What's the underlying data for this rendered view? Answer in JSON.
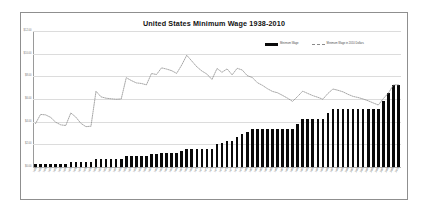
{
  "chart_data": {
    "type": "bar",
    "title": "United States Minimum Wage 1938-2010",
    "xlabel": "",
    "ylabel": "",
    "ylim": [
      0,
      12
    ],
    "yticks": [
      "$12.00",
      "$10.00",
      "$8.00",
      "$6.00",
      "$4.00",
      "$2.00",
      "$0.00"
    ],
    "grid": true,
    "legend_position": "top-right",
    "categories": [
      "1938",
      "1939",
      "1940",
      "1941",
      "1942",
      "1943",
      "1944",
      "1945",
      "1946",
      "1947",
      "1948",
      "1949",
      "1950",
      "1951",
      "1952",
      "1953",
      "1954",
      "1955",
      "1956",
      "1957",
      "1958",
      "1959",
      "1960",
      "1961",
      "1962",
      "1963",
      "1964",
      "1965",
      "1966",
      "1967",
      "1968",
      "1969",
      "1970",
      "1971",
      "1972",
      "1973",
      "1974",
      "1975",
      "1976",
      "1977",
      "1978",
      "1979",
      "1980",
      "1981",
      "1982",
      "1983",
      "1984",
      "1985",
      "1986",
      "1987",
      "1988",
      "1989",
      "1990",
      "1991",
      "1992",
      "1993",
      "1994",
      "1995",
      "1996",
      "1997",
      "1998",
      "1999",
      "2000",
      "2001",
      "2002",
      "2003",
      "2004",
      "2005",
      "2006",
      "2007",
      "2008",
      "2009",
      "2010"
    ],
    "series": [
      {
        "name": "Minimum Wage",
        "type": "bar",
        "color": "#0a0a0a",
        "values": [
          0.25,
          0.3,
          0.3,
          0.3,
          0.3,
          0.3,
          0.3,
          0.4,
          0.4,
          0.4,
          0.4,
          0.4,
          0.75,
          0.75,
          0.75,
          0.75,
          0.75,
          0.75,
          1.0,
          1.0,
          1.0,
          1.0,
          1.0,
          1.15,
          1.15,
          1.25,
          1.25,
          1.25,
          1.25,
          1.4,
          1.6,
          1.6,
          1.6,
          1.6,
          1.6,
          1.6,
          2.0,
          2.1,
          2.3,
          2.3,
          2.65,
          2.9,
          3.1,
          3.35,
          3.35,
          3.35,
          3.35,
          3.35,
          3.35,
          3.35,
          3.35,
          3.35,
          3.8,
          4.25,
          4.25,
          4.25,
          4.25,
          4.25,
          4.75,
          5.15,
          5.15,
          5.15,
          5.15,
          5.15,
          5.15,
          5.15,
          5.15,
          5.15,
          5.15,
          5.85,
          6.55,
          7.25,
          7.25
        ]
      },
      {
        "name": "Minimum Wage in 2010 Dollars",
        "type": "line",
        "style": "dotted",
        "color": "#8a8a8a",
        "values": [
          3.83,
          4.64,
          4.6,
          4.38,
          3.95,
          3.72,
          3.66,
          4.77,
          4.4,
          3.85,
          3.56,
          3.6,
          6.68,
          6.19,
          6.07,
          6.02,
          5.98,
          6.0,
          7.88,
          7.63,
          7.42,
          7.37,
          7.25,
          8.25,
          8.16,
          8.75,
          8.64,
          8.5,
          8.26,
          9.0,
          9.86,
          9.35,
          8.84,
          8.47,
          8.2,
          7.72,
          8.69,
          8.36,
          8.66,
          8.13,
          8.71,
          8.56,
          8.06,
          7.9,
          7.44,
          7.21,
          6.91,
          6.67,
          6.55,
          6.32,
          6.07,
          5.79,
          6.23,
          6.69,
          6.49,
          6.3,
          6.15,
          5.98,
          6.49,
          6.88,
          6.77,
          6.63,
          6.41,
          6.23,
          6.13,
          6.0,
          5.84,
          5.65,
          5.47,
          6.04,
          6.52,
          7.24,
          7.25
        ]
      }
    ]
  },
  "legend": {
    "entries": [
      {
        "label": "Minimum Wage",
        "marker": "solid-bar-swatch"
      },
      {
        "label": "Minimum Wage in 2010 Dollars",
        "marker": "dashed-line-swatch"
      }
    ]
  }
}
